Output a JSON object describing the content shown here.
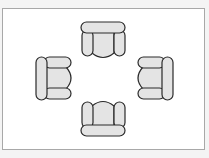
{
  "diagram": {
    "title": "",
    "colors": {
      "background": "#f4f4f4",
      "frame_fill": "#ffffff",
      "frame_border": "#a8a8a8",
      "chair_fill": "#e4e4e4",
      "chair_stroke": "#2a2a2a"
    },
    "chairs": [
      {
        "id": "top",
        "facing": "down"
      },
      {
        "id": "left",
        "facing": "right"
      },
      {
        "id": "right",
        "facing": "left"
      },
      {
        "id": "bottom",
        "facing": "up"
      }
    ]
  }
}
